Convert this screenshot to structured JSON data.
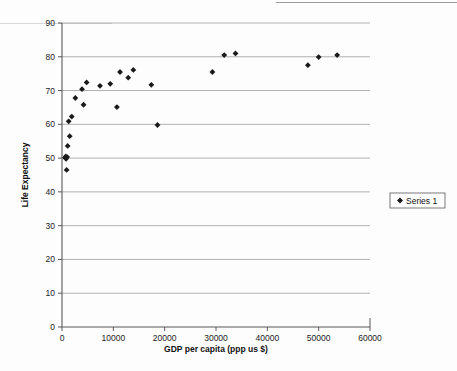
{
  "chart_data": {
    "type": "scatter",
    "title": "",
    "xlabel": "GDP per capita (ppp us $)",
    "ylabel": "Life Expectancy",
    "xlim": [
      0,
      60000
    ],
    "ylim": [
      0,
      90
    ],
    "xticks": [
      0,
      10000,
      20000,
      30000,
      40000,
      50000,
      60000
    ],
    "yticks": [
      0,
      10,
      20,
      30,
      40,
      50,
      60,
      70,
      80,
      90
    ],
    "xtick_labels": [
      "0",
      "10000",
      "20000",
      "30000",
      "40000",
      "50000",
      "60000"
    ],
    "ytick_labels": [
      "0",
      "10",
      "20",
      "30",
      "40",
      "50",
      "60",
      "70",
      "80",
      "90"
    ],
    "grid": "horizontal",
    "legend_position": "right",
    "marker": "diamond",
    "marker_color": "#1a1a1a",
    "series": [
      {
        "name": "Series 1",
        "points": [
          [
            600,
            50.2
          ],
          [
            700,
            50.0
          ],
          [
            750,
            50.5
          ],
          [
            800,
            49.8
          ],
          [
            900,
            46.5
          ],
          [
            1000,
            50.3
          ],
          [
            1100,
            53.6
          ],
          [
            1300,
            60.9
          ],
          [
            1500,
            56.5
          ],
          [
            1900,
            62.3
          ],
          [
            2600,
            67.8
          ],
          [
            3900,
            70.4
          ],
          [
            4200,
            65.8
          ],
          [
            4800,
            72.4
          ],
          [
            7400,
            71.4
          ],
          [
            9400,
            72.0
          ],
          [
            10700,
            65.1
          ],
          [
            11300,
            75.5
          ],
          [
            12900,
            73.8
          ],
          [
            13900,
            76.1
          ],
          [
            17400,
            71.7
          ],
          [
            18600,
            59.8
          ],
          [
            29300,
            75.5
          ],
          [
            31600,
            80.5
          ],
          [
            33800,
            81.0
          ],
          [
            47900,
            77.5
          ],
          [
            50000,
            79.9
          ],
          [
            53600,
            80.5
          ]
        ]
      }
    ]
  },
  "legend": {
    "entries": [
      {
        "label": "Series 1",
        "marker": "diamond"
      }
    ]
  }
}
